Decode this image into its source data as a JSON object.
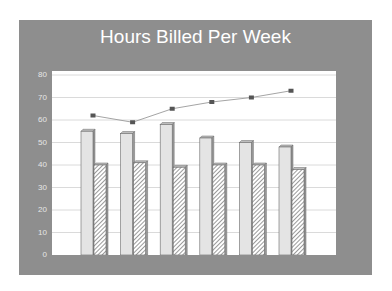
{
  "chart_data": {
    "type": "bar",
    "title": "Hours Billed Per Week",
    "xlabel": "",
    "ylabel": "",
    "ylim": [
      0,
      80
    ],
    "yticks": [
      0,
      10,
      20,
      30,
      40,
      50,
      60,
      70,
      80
    ],
    "grid": true,
    "legend": "none",
    "categories": [
      "1",
      "2",
      "3",
      "4",
      "5",
      "6"
    ],
    "series": [
      {
        "name": "Series 1 (solid bars)",
        "type": "bar",
        "style": "solid-light-gray",
        "values": [
          55,
          54,
          58,
          52,
          50,
          48
        ]
      },
      {
        "name": "Series 2 (hatched bars)",
        "type": "bar",
        "style": "hatched",
        "values": [
          40,
          41,
          39,
          40,
          40,
          38
        ]
      },
      {
        "name": "Series 3 (line)",
        "type": "line",
        "style": "square-markers",
        "values": [
          62,
          59,
          65,
          68,
          70,
          73
        ]
      }
    ]
  },
  "colors": {
    "panel": "#8e8e8e",
    "plot_bg": "#ffffff",
    "solid_bar": "#e4e4e4",
    "bar_edge": "#6a6a6a",
    "line": "#9a9a9a",
    "marker": "#555555",
    "title": "#ffffff"
  }
}
